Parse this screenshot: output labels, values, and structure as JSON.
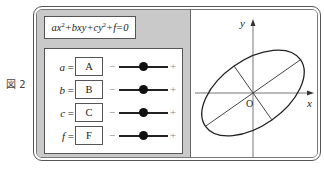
{
  "figure": {
    "label": "図 2"
  },
  "equation": {
    "parts": [
      "ax",
      "2",
      "+bxy+cy",
      "2",
      "+f=0"
    ]
  },
  "controls": {
    "rows": [
      {
        "var": "a",
        "eq": "=",
        "value": "A",
        "minus": "−",
        "plus": "+",
        "knob_pos": 0.5
      },
      {
        "var": "b",
        "eq": "=",
        "value": "B",
        "minus": "−",
        "plus": "+",
        "knob_pos": 0.5
      },
      {
        "var": "c",
        "eq": "=",
        "value": "C",
        "minus": "−",
        "plus": "+",
        "knob_pos": 0.5
      },
      {
        "var": "f",
        "eq": "=",
        "value": "F",
        "minus": "−",
        "plus": "+",
        "knob_pos": 0.5
      }
    ]
  },
  "plot": {
    "x_label": "x",
    "y_label": "y",
    "origin_label": "O",
    "ellipse": {
      "rotation_deg": -35,
      "semi_major": 58,
      "semi_minor": 33
    }
  }
}
